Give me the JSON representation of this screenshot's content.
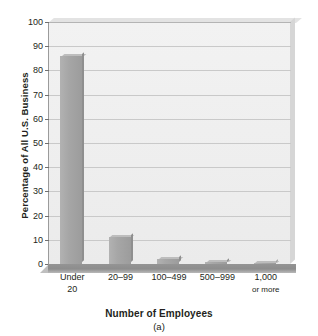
{
  "chart_data": {
    "type": "bar",
    "title": "",
    "subtitle": "",
    "panel_label": "(a)",
    "xlabel": "Number of Employees",
    "ylabel": "Percentage of All U.S. Business",
    "categories": [
      "Under 20",
      "20–99",
      "100–499",
      "500–999",
      "1,000 or more"
    ],
    "category_lines": [
      [
        "Under",
        "20"
      ],
      [
        "20–99",
        ""
      ],
      [
        "100–499",
        ""
      ],
      [
        "500–999",
        ""
      ],
      [
        "1,000",
        "or more"
      ]
    ],
    "values": [
      86,
      11,
      2,
      0.8,
      0.5
    ],
    "ylim": [
      0,
      100
    ],
    "ytick_step": 10,
    "yticks": [
      0,
      10,
      20,
      30,
      40,
      50,
      60,
      70,
      80,
      90,
      100
    ],
    "ytick_labels": [
      "0",
      "10",
      "20",
      "30",
      "40",
      "50",
      "60",
      "70",
      "80",
      "90",
      "100"
    ],
    "grid": true,
    "legend": false,
    "legend_position": "none",
    "bar_color": "#a6a6a6",
    "plot_background": "#efefef",
    "gridline_color": "#c9c9c9",
    "axis_color": "#6f6f6f"
  }
}
